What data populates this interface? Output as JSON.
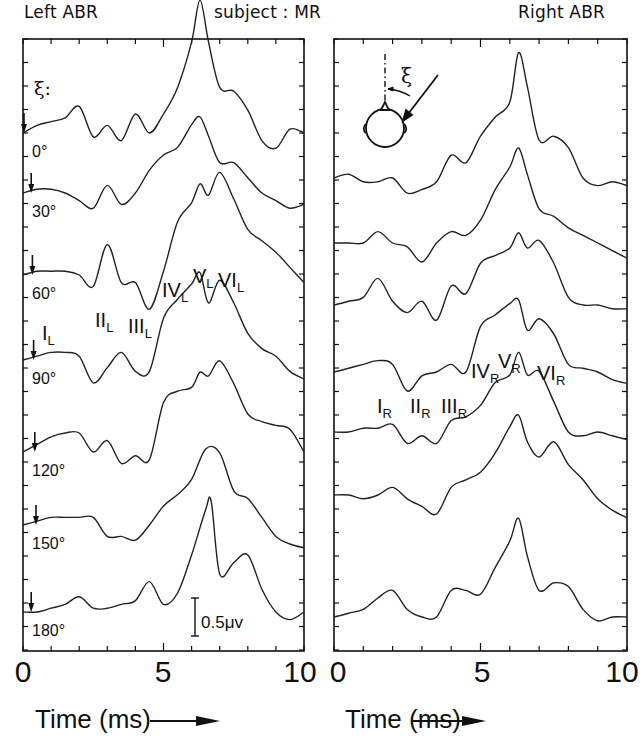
{
  "header": {
    "left_title": "Left ABR",
    "center_title": "subject : MR",
    "right_title": "Right ABR"
  },
  "chart_data": [
    {
      "type": "line",
      "title": "Left ABR",
      "xlabel": "Time (ms)",
      "ylabel": "",
      "xlim": [
        0,
        10
      ],
      "x_ticks": [
        0,
        5,
        10
      ],
      "grid": false,
      "angle_symbol": "ξ:",
      "scale_bar": "0.5μv",
      "series": [
        {
          "name": "0°",
          "x": [
            0,
            0.5,
            1,
            1.5,
            2,
            2.5,
            3,
            3.5,
            4,
            4.5,
            5,
            5.5,
            6,
            6.3,
            6.6,
            7,
            7.5,
            8,
            8.5,
            9,
            9.5,
            10
          ],
          "y": [
            0,
            0.1,
            0.15,
            0.2,
            0.35,
            -0.05,
            0.1,
            -0.1,
            0.25,
            0.0,
            0.25,
            0.6,
            1.2,
            1.75,
            1.2,
            0.6,
            0.55,
            0.3,
            -0.1,
            -0.2,
            0.05,
            0.0
          ]
        },
        {
          "name": "30°",
          "x": [
            0,
            0.5,
            1,
            1.5,
            2,
            2.5,
            3,
            3.5,
            4,
            4.5,
            5,
            5.5,
            6,
            6.3,
            6.6,
            7,
            7.5,
            8,
            8.5,
            9,
            9.5,
            10
          ],
          "y": [
            0,
            0.05,
            0.05,
            0.0,
            -0.1,
            -0.2,
            0.1,
            -0.15,
            0.0,
            0.3,
            0.5,
            0.6,
            0.9,
            1.0,
            0.75,
            0.4,
            0.4,
            0.2,
            0.0,
            -0.1,
            -0.2,
            -0.15
          ]
        },
        {
          "name": "60°",
          "x": [
            0,
            0.5,
            1,
            1.5,
            2,
            2.5,
            3,
            3.5,
            4,
            4.5,
            5,
            5.5,
            6,
            6.3,
            6.6,
            7,
            7.5,
            8,
            8.5,
            9,
            9.5,
            10
          ],
          "y": [
            0,
            0.05,
            0.05,
            0.05,
            0.0,
            -0.15,
            0.4,
            -0.1,
            -0.1,
            -0.45,
            0.05,
            0.7,
            0.95,
            1.2,
            1.05,
            1.35,
            1.0,
            0.6,
            0.45,
            0.3,
            0.1,
            -0.1
          ]
        },
        {
          "name": "90°",
          "x": [
            0,
            0.5,
            1,
            1.5,
            2,
            2.5,
            3,
            3.5,
            4,
            4.5,
            5,
            5.5,
            6,
            6.3,
            6.6,
            7,
            7.5,
            8,
            8.5,
            9,
            9.5,
            10
          ],
          "y": [
            0,
            0.05,
            0.1,
            0.1,
            0.05,
            -0.3,
            -0.1,
            0.1,
            -0.15,
            -0.15,
            0.55,
            0.8,
            1.0,
            1.15,
            0.75,
            1.05,
            0.75,
            0.35,
            0.15,
            0.05,
            -0.15,
            -0.25
          ]
        },
        {
          "name": "120°",
          "x": [
            0,
            0.5,
            1,
            1.5,
            2,
            2.5,
            3,
            3.5,
            4,
            4.5,
            5,
            5.5,
            6,
            6.3,
            6.6,
            7,
            7.5,
            8,
            8.5,
            9,
            9.5,
            10
          ],
          "y": [
            0,
            0.1,
            0.2,
            0.25,
            0.25,
            0.0,
            0.15,
            -0.15,
            -0.05,
            -0.1,
            0.65,
            0.8,
            0.85,
            1.05,
            1.0,
            1.2,
            0.9,
            0.5,
            0.4,
            0.35,
            0.3,
            0.0
          ]
        },
        {
          "name": "150°",
          "x": [
            0,
            0.5,
            1,
            1.5,
            2,
            2.5,
            3,
            3.5,
            4,
            4.5,
            5,
            5.5,
            6,
            6.5,
            7,
            7.5,
            8,
            8.5,
            9,
            9.5,
            10
          ],
          "y": [
            0,
            0.05,
            0.1,
            0.1,
            0.1,
            0.1,
            -0.15,
            -0.15,
            -0.2,
            0.0,
            0.25,
            0.4,
            0.6,
            1.0,
            0.95,
            0.45,
            0.35,
            0.1,
            -0.15,
            -0.25,
            -0.3
          ]
        },
        {
          "name": "180°",
          "x": [
            0,
            0.5,
            1,
            1.5,
            2,
            2.5,
            3,
            3.5,
            4,
            4.5,
            5,
            5.5,
            6,
            6.5,
            6.7,
            7,
            7.5,
            8,
            8.5,
            9,
            9.5,
            10
          ],
          "y": [
            0,
            0.0,
            0.05,
            0.1,
            0.2,
            0.05,
            0.05,
            0.1,
            0.15,
            0.4,
            0.1,
            0.25,
            0.75,
            1.35,
            1.45,
            0.5,
            0.65,
            0.75,
            0.3,
            0.0,
            -0.1,
            0.0
          ]
        }
      ],
      "annotations": [
        "I_L",
        "II_L",
        "III_L",
        "IV_L",
        "V_L",
        "VI_L"
      ]
    },
    {
      "type": "line",
      "title": "Right ABR",
      "xlabel": "Time (ms)",
      "ylabel": "",
      "xlim": [
        0,
        10
      ],
      "x_ticks": [
        0,
        5,
        10
      ],
      "grid": false,
      "series": [
        {
          "name": "0°",
          "x": [
            0,
            0.5,
            1,
            1.5,
            2,
            2.5,
            3,
            3.5,
            4,
            4.5,
            5,
            5.5,
            6,
            6.3,
            6.6,
            7,
            7.5,
            8,
            8.5,
            9,
            9.5,
            10
          ],
          "y": [
            0,
            0.05,
            -0.05,
            -0.05,
            0.0,
            -0.2,
            -0.15,
            -0.05,
            0.3,
            0.2,
            0.55,
            0.8,
            1.0,
            1.65,
            1.2,
            0.5,
            0.55,
            0.4,
            0.0,
            -0.1,
            -0.05,
            -0.1
          ]
        },
        {
          "name": "30°",
          "x": [
            0,
            0.5,
            1,
            1.5,
            2,
            2.5,
            3,
            3.5,
            4,
            4.5,
            5,
            5.5,
            6,
            6.3,
            6.6,
            7,
            7.5,
            8,
            8.5,
            9,
            9.5,
            10
          ],
          "y": [
            0,
            0.0,
            0.0,
            0.15,
            0.0,
            -0.05,
            -0.25,
            0.0,
            0.15,
            0.1,
            0.3,
            0.7,
            1.0,
            1.25,
            0.9,
            0.45,
            0.35,
            0.2,
            0.1,
            0.0,
            -0.1,
            -0.2
          ]
        },
        {
          "name": "60°",
          "x": [
            0,
            0.5,
            1,
            1.5,
            2,
            2.5,
            3,
            3.5,
            4,
            4.5,
            5,
            5.5,
            6,
            6.3,
            6.6,
            7,
            7.5,
            8,
            8.5,
            9,
            9.5,
            10
          ],
          "y": [
            0,
            0.05,
            0.1,
            0.35,
            0.05,
            -0.1,
            0.05,
            -0.2,
            0.25,
            0.15,
            0.55,
            0.65,
            0.75,
            0.95,
            0.75,
            0.85,
            0.55,
            0.1,
            0.0,
            0.0,
            -0.05,
            -0.05
          ]
        },
        {
          "name": "90°",
          "x": [
            0,
            0.5,
            1,
            1.5,
            2,
            2.5,
            3,
            3.5,
            4,
            4.5,
            5,
            5.5,
            6,
            6.3,
            6.6,
            7,
            7.5,
            8,
            8.5,
            9,
            9.5,
            10
          ],
          "y": [
            0,
            0.05,
            0.1,
            0.15,
            0.1,
            -0.25,
            -0.05,
            0.0,
            0.1,
            0.0,
            0.6,
            0.75,
            0.9,
            0.95,
            0.55,
            0.7,
            0.5,
            0.1,
            0.05,
            0.0,
            -0.1,
            -0.15
          ]
        },
        {
          "name": "120°",
          "x": [
            0,
            0.5,
            1,
            1.5,
            2,
            2.5,
            3,
            3.5,
            4,
            4.5,
            5,
            5.5,
            6,
            6.3,
            6.6,
            7,
            7.5,
            8,
            8.5,
            9,
            9.5,
            10
          ],
          "y": [
            0,
            0.0,
            0.05,
            0.05,
            0.1,
            -0.15,
            -0.05,
            -0.15,
            0.15,
            0.2,
            0.35,
            0.65,
            0.75,
            1.05,
            0.75,
            0.8,
            0.4,
            0.0,
            -0.05,
            0.0,
            -0.05,
            -0.1
          ]
        },
        {
          "name": "150°",
          "x": [
            0,
            0.5,
            1,
            1.5,
            2,
            2.5,
            3,
            3.5,
            4,
            4.5,
            5,
            5.5,
            6,
            6.3,
            6.6,
            7,
            7.5,
            8,
            8.5,
            9,
            9.5,
            10
          ],
          "y": [
            0,
            0.0,
            -0.05,
            0.0,
            0.1,
            -0.05,
            -0.15,
            -0.25,
            0.1,
            0.2,
            0.3,
            0.55,
            0.9,
            1.05,
            0.7,
            0.5,
            0.7,
            0.4,
            0.2,
            -0.05,
            -0.2,
            -0.3
          ]
        },
        {
          "name": "180°",
          "x": [
            0,
            0.5,
            1,
            1.5,
            2,
            2.5,
            3,
            3.5,
            4,
            4.5,
            5,
            5.5,
            6,
            6.3,
            6.6,
            7,
            7.5,
            8,
            8.5,
            9,
            9.5,
            10
          ],
          "y": [
            0,
            0.05,
            0.1,
            0.25,
            0.35,
            0.1,
            0.0,
            0.0,
            0.35,
            0.35,
            0.3,
            0.65,
            1.0,
            1.3,
            0.8,
            0.35,
            0.45,
            0.4,
            0.1,
            -0.05,
            0.0,
            0.0
          ]
        }
      ],
      "annotations": [
        "I_R",
        "II_R",
        "III_R",
        "IV_R",
        "V_R",
        "VI_R"
      ]
    }
  ],
  "left_panel": {
    "angle_label": "ξ:",
    "angles": [
      "0°",
      "30°",
      "60°",
      "90°",
      "120°",
      "150°",
      "180°"
    ],
    "scale_bar": "0.5μv",
    "peaks": [
      {
        "roman": "I",
        "sub": "L"
      },
      {
        "roman": "II",
        "sub": "L"
      },
      {
        "roman": "III",
        "sub": "L"
      },
      {
        "roman": "IV",
        "sub": "L"
      },
      {
        "roman": "V",
        "sub": "L"
      },
      {
        "roman": "VI",
        "sub": "L"
      }
    ]
  },
  "right_panel": {
    "head_symbol": "ξ",
    "peaks": [
      {
        "roman": "I",
        "sub": "R"
      },
      {
        "roman": "II",
        "sub": "R"
      },
      {
        "roman": "III",
        "sub": "R"
      },
      {
        "roman": "IV",
        "sub": "R"
      },
      {
        "roman": "V",
        "sub": "R"
      },
      {
        "roman": "VI",
        "sub": "R"
      }
    ]
  },
  "x_axis": {
    "ticks": [
      "0",
      "5",
      "10"
    ],
    "label": "Time (ms)"
  }
}
